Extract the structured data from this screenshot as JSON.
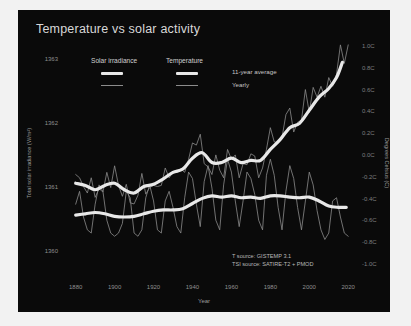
{
  "title": "Temperature vs solar activity",
  "colors": {
    "background": "#f2f2f2",
    "panel": "#0a0a0a",
    "smooth_line": "#e8e8e8",
    "yearly_line": "#8c8c8c",
    "text": "#d0d0d0",
    "tick_text": "#8f8f8f"
  },
  "legend": {
    "columns": [
      {
        "label": "Solar irradiance"
      },
      {
        "label": "Temperature"
      }
    ],
    "rows": [
      {
        "label": "11-year average",
        "style": "thick"
      },
      {
        "label": "Yearly",
        "style": "thin"
      }
    ]
  },
  "sources": {
    "line1": "T source: GISTEMP 3.1",
    "line2": "TSI source: SATIRE-T2 + PMOD"
  },
  "chart_data": {
    "type": "line",
    "title": "Temperature vs solar activity",
    "xlabel": "Year",
    "ylabel": "Total solar irradiance (W/m²)",
    "y2label": "Degrees Celsius (C)",
    "xlim": [
      1874,
      2024
    ],
    "xticks": [
      1880,
      1900,
      1920,
      1940,
      1960,
      1980,
      2000,
      2020
    ],
    "xticklabels": [
      "1880",
      "1900",
      "1920",
      "1940",
      "1960",
      "1980",
      "2000",
      "2020"
    ],
    "ylim": [
      1359.6,
      1363.4
    ],
    "yticks": [
      1360,
      1361,
      1362,
      1363
    ],
    "yticklabels": [
      "1360",
      "1361",
      "1362",
      "1363"
    ],
    "y2lim": [
      -1.12,
      1.12
    ],
    "y2ticks": [
      1.0,
      0.8,
      0.6,
      0.4,
      0.2,
      0.0,
      -0.2,
      -0.4,
      -0.6,
      -0.8,
      -1.0
    ],
    "y2ticklabels": [
      "1.0C",
      "0.8C",
      "0.6C",
      "0.4C",
      "0.2C",
      "0.0C",
      "-0.2C",
      "-0.4C",
      "-0.6C",
      "-0.8C",
      "-1.0C"
    ],
    "grid": false,
    "legend_position": "upper-left-inside",
    "series": [
      {
        "name": "Solar irradiance yearly",
        "axis": "left",
        "style": "thin",
        "color": "#8c8c8c",
        "x": [
          1880,
          1882,
          1884,
          1886,
          1888,
          1890,
          1892,
          1894,
          1896,
          1898,
          1900,
          1902,
          1904,
          1906,
          1908,
          1910,
          1912,
          1914,
          1916,
          1918,
          1920,
          1922,
          1924,
          1926,
          1928,
          1930,
          1932,
          1934,
          1936,
          1938,
          1940,
          1942,
          1944,
          1946,
          1948,
          1950,
          1952,
          1954,
          1956,
          1958,
          1960,
          1962,
          1964,
          1966,
          1968,
          1970,
          1972,
          1974,
          1976,
          1978,
          1980,
          1982,
          1984,
          1986,
          1988,
          1990,
          1992,
          1994,
          1996,
          1998,
          2000,
          2002,
          2004,
          2006,
          2008,
          2010,
          2012,
          2014,
          2016,
          2018,
          2020
        ],
        "y": [
          1360.75,
          1360.95,
          1360.55,
          1360.35,
          1360.3,
          1360.75,
          1361.05,
          1360.95,
          1360.5,
          1360.3,
          1360.25,
          1360.3,
          1360.45,
          1360.95,
          1360.85,
          1360.3,
          1360.25,
          1360.35,
          1360.85,
          1361.05,
          1360.8,
          1360.35,
          1360.3,
          1360.8,
          1360.95,
          1360.7,
          1360.4,
          1360.3,
          1360.85,
          1361.25,
          1361.15,
          1360.75,
          1360.4,
          1361.1,
          1361.35,
          1361.0,
          1360.5,
          1360.35,
          1361.05,
          1361.45,
          1361.25,
          1360.8,
          1360.4,
          1360.8,
          1361.25,
          1361.15,
          1360.9,
          1360.5,
          1360.35,
          1361.2,
          1361.45,
          1361.2,
          1360.7,
          1360.35,
          1360.95,
          1361.35,
          1361.15,
          1360.7,
          1360.35,
          1360.8,
          1361.25,
          1361.05,
          1360.65,
          1360.35,
          1360.2,
          1360.3,
          1360.8,
          1360.85,
          1360.55,
          1360.3,
          1360.25
        ]
      },
      {
        "name": "Solar irradiance 11-year average",
        "axis": "left",
        "style": "thick",
        "color": "#e8e8e8",
        "x": [
          1880,
          1885,
          1890,
          1895,
          1900,
          1905,
          1910,
          1915,
          1920,
          1925,
          1930,
          1935,
          1940,
          1945,
          1950,
          1955,
          1960,
          1965,
          1970,
          1975,
          1980,
          1985,
          1990,
          1995,
          2000,
          2005,
          2010,
          2015,
          2019
        ],
        "y": [
          1360.58,
          1360.6,
          1360.62,
          1360.6,
          1360.56,
          1360.55,
          1360.56,
          1360.6,
          1360.64,
          1360.66,
          1360.66,
          1360.68,
          1360.76,
          1360.84,
          1360.88,
          1360.86,
          1360.88,
          1360.85,
          1360.86,
          1360.84,
          1360.88,
          1360.88,
          1360.86,
          1360.85,
          1360.86,
          1360.8,
          1360.72,
          1360.7,
          1360.7
        ]
      },
      {
        "name": "Temperature yearly",
        "axis": "right",
        "style": "thin",
        "color": "#8c8c8c",
        "x": [
          1880,
          1882,
          1884,
          1886,
          1888,
          1890,
          1892,
          1894,
          1896,
          1898,
          1900,
          1902,
          1904,
          1906,
          1908,
          1910,
          1912,
          1914,
          1916,
          1918,
          1920,
          1922,
          1924,
          1926,
          1928,
          1930,
          1932,
          1934,
          1936,
          1938,
          1940,
          1942,
          1944,
          1946,
          1948,
          1950,
          1952,
          1954,
          1956,
          1958,
          1960,
          1962,
          1964,
          1966,
          1968,
          1970,
          1972,
          1974,
          1976,
          1978,
          1980,
          1982,
          1984,
          1986,
          1988,
          1990,
          1992,
          1994,
          1996,
          1998,
          2000,
          2002,
          2004,
          2006,
          2008,
          2010,
          2012,
          2014,
          2016,
          2018,
          2020
        ],
        "y": [
          -0.17,
          -0.2,
          -0.28,
          -0.34,
          -0.2,
          -0.38,
          -0.3,
          -0.33,
          -0.15,
          -0.29,
          -0.09,
          -0.27,
          -0.37,
          -0.26,
          -0.43,
          -0.44,
          -0.36,
          -0.16,
          -0.35,
          -0.29,
          -0.27,
          -0.28,
          -0.27,
          -0.11,
          -0.2,
          -0.15,
          -0.15,
          -0.12,
          -0.15,
          -0.03,
          0.12,
          0.1,
          0.2,
          -0.07,
          -0.1,
          -0.17,
          0.01,
          -0.13,
          -0.2,
          0.06,
          -0.03,
          0.01,
          -0.2,
          -0.07,
          -0.08,
          0.02,
          0.0,
          -0.2,
          -0.11,
          0.06,
          0.26,
          0.13,
          0.12,
          0.17,
          0.38,
          0.44,
          0.22,
          0.31,
          0.33,
          0.61,
          0.4,
          0.63,
          0.54,
          0.64,
          0.54,
          0.72,
          0.64,
          0.75,
          1.02,
          0.85,
          1.02
        ]
      },
      {
        "name": "Temperature 11-year average",
        "axis": "right",
        "style": "thick",
        "color": "#e8e8e8",
        "x": [
          1880,
          1885,
          1890,
          1895,
          1900,
          1905,
          1910,
          1915,
          1920,
          1925,
          1930,
          1935,
          1940,
          1945,
          1950,
          1955,
          1960,
          1965,
          1970,
          1975,
          1980,
          1985,
          1990,
          1995,
          2000,
          2005,
          2010,
          2014,
          2017
        ],
        "y": [
          -0.25,
          -0.27,
          -0.31,
          -0.27,
          -0.25,
          -0.31,
          -0.34,
          -0.28,
          -0.26,
          -0.21,
          -0.15,
          -0.12,
          -0.02,
          0.03,
          -0.06,
          -0.06,
          -0.02,
          -0.06,
          -0.04,
          -0.04,
          0.06,
          0.15,
          0.26,
          0.3,
          0.42,
          0.54,
          0.62,
          0.72,
          0.86
        ]
      }
    ]
  }
}
